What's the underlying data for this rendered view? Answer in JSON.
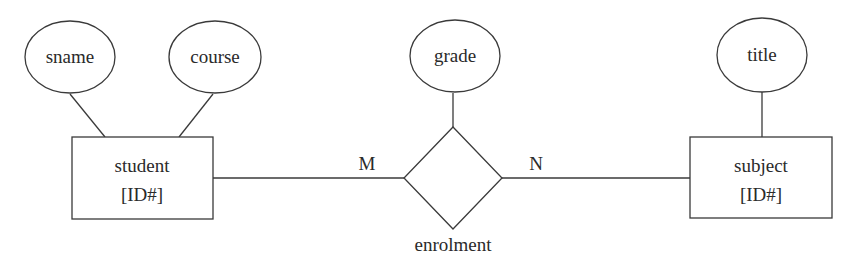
{
  "diagram": {
    "type": "entity-relationship",
    "entities": [
      {
        "id": "student",
        "label": "student",
        "key": "[ID#]"
      },
      {
        "id": "subject",
        "label": "subject",
        "key": "[ID#]"
      }
    ],
    "relationship": {
      "id": "enrolment",
      "label": "enrolment"
    },
    "attributes": [
      {
        "label": "sname",
        "of": "student"
      },
      {
        "label": "course",
        "of": "student"
      },
      {
        "label": "grade",
        "of": "enrolment"
      },
      {
        "label": "title",
        "of": "subject"
      }
    ],
    "cardinality": {
      "left": "M",
      "right": "N"
    }
  }
}
